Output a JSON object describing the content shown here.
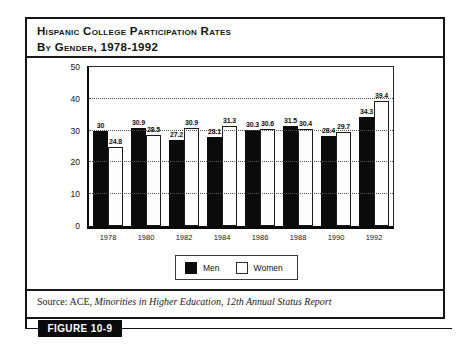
{
  "header": {
    "title_line1": "Hispanic College Participation Rates",
    "title_line2": "By Gender, 1978-1992"
  },
  "footer": {
    "source_prefix": "Source: ACE, ",
    "source_italic": "Minorities in Higher Education, 12th Annual Status Report",
    "figure_label": "FIGURE 10-9"
  },
  "chart_data": {
    "type": "bar",
    "title": "Hispanic College Participation Rates By Gender, 1978-1992",
    "categories": [
      "1978",
      "1980",
      "1982",
      "1984",
      "1986",
      "1988",
      "1990",
      "1992"
    ],
    "series": [
      {
        "name": "Men",
        "color": "#0b0b0b",
        "values": [
          30,
          30.9,
          27.2,
          28.1,
          30.3,
          31.5,
          28.4,
          34.3
        ]
      },
      {
        "name": "Women",
        "color": "#fdfdfd",
        "values": [
          24.8,
          28.5,
          30.9,
          31.3,
          30.6,
          30.4,
          29.7,
          39.4
        ]
      }
    ],
    "xlabel": "",
    "ylabel": "",
    "ylim": [
      0,
      50
    ],
    "yticks": [
      0,
      10,
      20,
      30,
      40,
      50
    ],
    "gridlines_at": [
      10,
      20,
      30,
      40
    ],
    "grid_style": "dotted",
    "legend_position": "bottom-center",
    "value_labels": true
  }
}
